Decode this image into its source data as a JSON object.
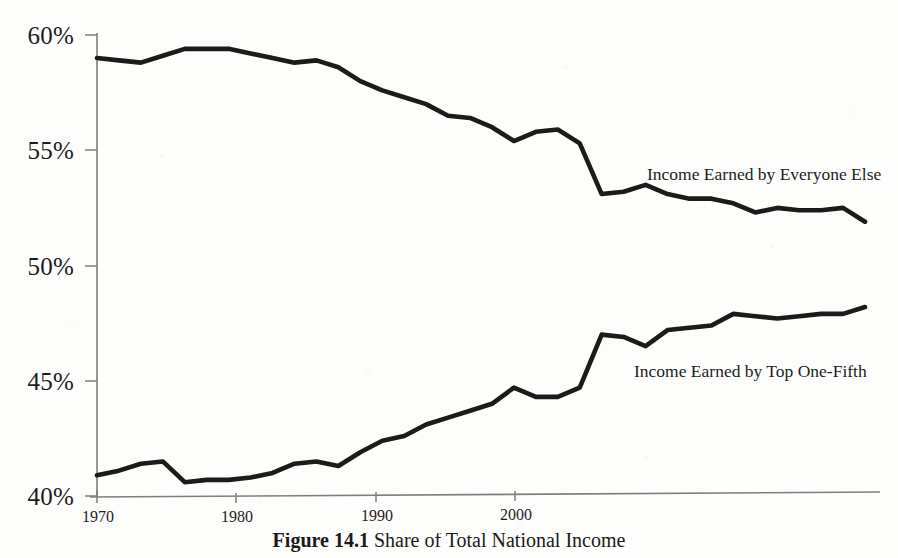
{
  "figure": {
    "caption_label": "Figure 14.1",
    "caption_body": "Share of Total National Income",
    "caption_full": "Figure 14.1  Share of Total National Income",
    "ink_color": "#1c1b1a",
    "axis_color": "#807e7c",
    "page_color": "#fdfdfc"
  },
  "annotations": {
    "upper_series_label": "Income Earned by Everyone Else",
    "lower_series_label": "Income Earned by Top One-Fifth"
  },
  "axes": {
    "y_tick_labels": [
      "60%",
      "55%",
      "50%",
      "45%",
      "40%"
    ],
    "y_tick_values": [
      60,
      55,
      50,
      45,
      40
    ],
    "x_tick_labels": [
      "1970",
      "1980",
      "1990",
      "2000"
    ],
    "x_tick_values": [
      1970,
      1980,
      1990,
      2000
    ]
  },
  "chart_data": {
    "type": "line",
    "title": "Share of Total National Income",
    "xlabel": "",
    "ylabel": "",
    "xlim": [
      1970,
      2005
    ],
    "ylim": [
      40,
      60
    ],
    "grid": false,
    "legend": "inline-labels",
    "x": [
      1970,
      1971,
      1972,
      1973,
      1974,
      1975,
      1976,
      1977,
      1978,
      1979,
      1980,
      1981,
      1982,
      1983,
      1984,
      1985,
      1986,
      1987,
      1988,
      1989,
      1990,
      1991,
      1992,
      1993,
      1994,
      1995,
      1996,
      1997,
      1998,
      1999,
      2000,
      2001,
      2002,
      2003,
      2004,
      2005
    ],
    "series": [
      {
        "name": "Income Earned by Everyone Else",
        "values": [
          59.0,
          58.9,
          58.8,
          59.1,
          59.4,
          59.4,
          59.4,
          59.2,
          59.0,
          58.8,
          58.9,
          58.6,
          58.0,
          57.6,
          57.3,
          57.0,
          56.5,
          56.4,
          56.0,
          55.4,
          55.8,
          55.9,
          55.3,
          53.1,
          53.2,
          53.5,
          53.1,
          52.9,
          52.9,
          52.7,
          52.3,
          52.5,
          52.4,
          52.4,
          52.5,
          51.9
        ]
      },
      {
        "name": "Income Earned by Top One-Fifth",
        "values": [
          40.9,
          41.1,
          41.4,
          41.5,
          40.6,
          40.7,
          40.7,
          40.8,
          41.0,
          41.4,
          41.5,
          41.3,
          41.9,
          42.4,
          42.6,
          43.1,
          43.4,
          43.7,
          44.0,
          44.7,
          44.3,
          44.3,
          44.7,
          47.0,
          46.9,
          46.5,
          47.2,
          47.3,
          47.4,
          47.9,
          47.8,
          47.7,
          47.8,
          47.9,
          47.9,
          48.2
        ]
      }
    ]
  }
}
